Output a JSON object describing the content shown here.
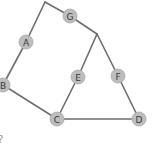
{
  "diagram": {
    "type": "graph",
    "node_radius": 7,
    "colors": {
      "node_fill": "#bdbdbd",
      "edge": "#6e6e6e",
      "label": "#3a3a3a"
    },
    "nodes": [
      {
        "id": "A",
        "label": "A",
        "x": 26,
        "y": 42
      },
      {
        "id": "B",
        "label": "B",
        "x": 3,
        "y": 85
      },
      {
        "id": "C",
        "label": "C",
        "x": 57,
        "y": 119
      },
      {
        "id": "D",
        "label": "D",
        "x": 139,
        "y": 119
      },
      {
        "id": "E",
        "label": "E",
        "x": 78,
        "y": 77
      },
      {
        "id": "F",
        "label": "F",
        "x": 118,
        "y": 76
      },
      {
        "id": "G",
        "label": "G",
        "x": 70,
        "y": 16
      }
    ],
    "waypoints": [
      {
        "id": "P1",
        "x": 45,
        "y": 2
      },
      {
        "id": "P2",
        "x": 97,
        "y": 34
      }
    ],
    "edges": [
      {
        "from": "B",
        "to": "A"
      },
      {
        "from": "A",
        "to": "P1"
      },
      {
        "from": "P1",
        "to": "G"
      },
      {
        "from": "G",
        "to": "P2"
      },
      {
        "from": "P2",
        "to": "E"
      },
      {
        "from": "P2",
        "to": "F"
      },
      {
        "from": "E",
        "to": "C"
      },
      {
        "from": "F",
        "to": "D"
      },
      {
        "from": "B",
        "to": "C"
      },
      {
        "from": "C",
        "to": "D"
      }
    ],
    "stray_text": "?"
  }
}
